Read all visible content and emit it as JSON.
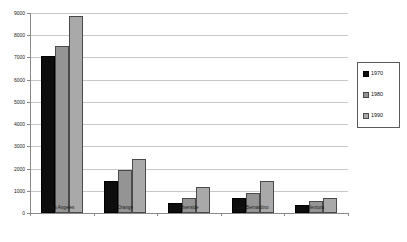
{
  "chart_data": {
    "type": "bar",
    "title": "",
    "xlabel": "",
    "ylabel": "",
    "ylim": [
      0,
      9000
    ],
    "ytick_step": 1000,
    "yticks": [
      0,
      1000,
      2000,
      3000,
      4000,
      5000,
      6000,
      7000,
      8000,
      9000
    ],
    "ytick_labels": [
      "0",
      "1000",
      "2000",
      "3000",
      "4000",
      "5000",
      "6000",
      "7000",
      "8000",
      "9000"
    ],
    "grid": true,
    "grid_axis": "y",
    "legend_position": "right",
    "categories": [
      "Los Angeles",
      "Orange",
      "Riverside",
      "San Bernardino",
      "Ventura"
    ],
    "series": [
      {
        "name": "1970",
        "color": "#0d0d0d",
        "values": [
          7050,
          1430,
          460,
          690,
          380
        ]
      },
      {
        "name": "1980",
        "color": "#949494",
        "values": [
          7500,
          1930,
          660,
          900,
          530
        ]
      },
      {
        "name": "1990",
        "color": "#a9a9a9",
        "values": [
          8870,
          2420,
          1180,
          1460,
          670
        ]
      }
    ]
  },
  "legend": {
    "entries": [
      {
        "label": "1970"
      },
      {
        "label": "1980"
      },
      {
        "label": "1990"
      }
    ]
  }
}
